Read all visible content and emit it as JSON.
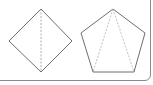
{
  "diagram": {
    "colors": {
      "border": "#8a8a8a",
      "solid_edge": "#6e6e6e",
      "dashed_line": "#9a9a9a",
      "background": "#ffffff"
    },
    "figures": [
      {
        "name": "square-diamond",
        "shape": "square",
        "vertices": [
          [
            41,
            9
          ],
          [
            72,
            41
          ],
          [
            41,
            72
          ],
          [
            9,
            41
          ]
        ],
        "dashed_lines": [
          [
            [
              41,
              9
            ],
            [
              41,
              72
            ]
          ]
        ]
      },
      {
        "name": "pentagon",
        "shape": "regular pentagon",
        "vertices": [
          [
            113,
            9
          ],
          [
            145,
            33
          ],
          [
            134,
            72
          ],
          [
            93,
            72
          ],
          [
            81,
            33
          ]
        ],
        "dashed_lines": [
          [
            [
              113,
              9
            ],
            [
              93,
              72
            ]
          ],
          [
            [
              113,
              9
            ],
            [
              134,
              72
            ]
          ]
        ]
      }
    ]
  }
}
